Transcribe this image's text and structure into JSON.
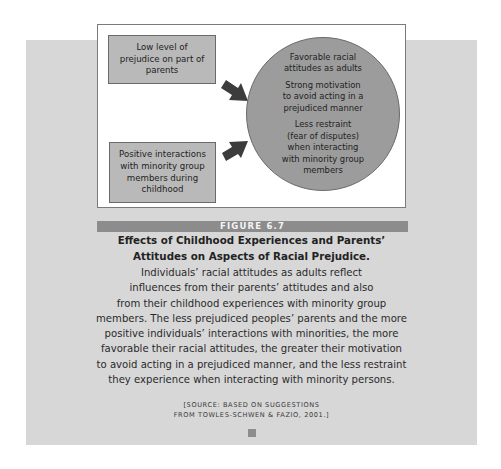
{
  "diagram": {
    "input_boxes": [
      {
        "label": "Low level of prejudice on part of parents",
        "lines": [
          "Low level of",
          "prejudice on part of",
          "parents"
        ]
      },
      {
        "label": "Positive interactions with minority group members during childhood",
        "lines": [
          "Positive interactions",
          "with minority group",
          "members during",
          "childhood"
        ]
      }
    ],
    "outcome_circle": {
      "items": [
        {
          "lines": [
            "Favorable racial",
            "attitudes as adults"
          ]
        },
        {
          "lines": [
            "Strong motivation",
            "to avoid acting in a",
            "prejudiced manner"
          ]
        },
        {
          "lines": [
            "Less restraint",
            "(fear of disputes)",
            "when interacting",
            "with minority group",
            "members"
          ]
        }
      ]
    },
    "arrows": [
      {
        "from": "input_boxes.0",
        "to": "outcome_circle"
      },
      {
        "from": "input_boxes.1",
        "to": "outcome_circle"
      }
    ],
    "colors": {
      "panel_background": "#d7d7d7",
      "box_fill": "#b9b9b9",
      "circle_fill": "#9c9c9c",
      "arrow": "#3c3c3c",
      "figure_bar": "#8c8c8c"
    }
  },
  "caption": {
    "figure_label": "FIGURE 6.7",
    "title_lines": [
      "Effects of Childhood Experiences and Parents’",
      "Attitudes on Aspects of Racial Prejudice."
    ],
    "body_lines": [
      "Individuals’ racial attitudes as adults reflect",
      "influences from their parents’ attitudes and also",
      "from their childhood experiences with minority group",
      "members. The less prejudiced peoples’ parents and the more",
      "positive individuals’ interactions with minorities, the more",
      "favorable their racial attitudes, the greater their motivation",
      "to avoid acting in a prejudiced manner, and the less restraint",
      "they experience when interacting with minority persons."
    ],
    "source_lines": [
      "[SOURCE: BASED ON SUGGESTIONS",
      "FROM TOWLES-SCHWEN & FAZIO, 2001.]"
    ]
  }
}
